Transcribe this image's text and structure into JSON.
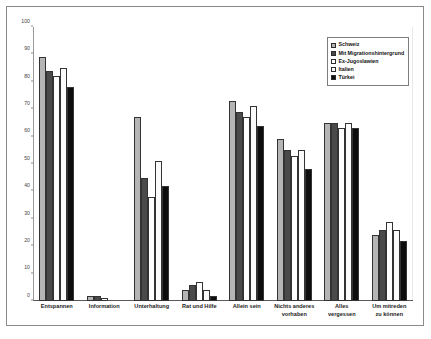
{
  "figure": {
    "cut_heading_text": "",
    "frame_color": "#8a8a8a",
    "background": "#ffffff"
  },
  "legend": {
    "position": "top-right",
    "items": [
      {
        "label": "Schweiz",
        "color": "#b5b5b5",
        "swatch": "legend-swatch-light-gray"
      },
      {
        "label": "Mit Migrationshintergrund",
        "color": "#4a4a4a",
        "swatch": "legend-swatch-dark-gray"
      },
      {
        "label": "Ex-Jugoslawien",
        "color": "#ffffff",
        "swatch": "legend-swatch-white"
      },
      {
        "label": "Italien",
        "color": "#fbfbfb",
        "swatch": "legend-swatch-offwhite"
      },
      {
        "label": "Türkei",
        "color": "#0d0d0d",
        "swatch": "legend-swatch-black"
      }
    ]
  },
  "axes": {
    "y_ticks": [
      "0",
      "10",
      "20",
      "30",
      "40",
      "50",
      "60",
      "70",
      "80",
      "90",
      "100"
    ],
    "x_tick_lines": [
      [
        "Entspannen"
      ],
      [
        "Information"
      ],
      [
        "Unterhaltung"
      ],
      [
        "Rat und Hilfe"
      ],
      [
        "Allein sein"
      ],
      [
        "Nichts anderes",
        "vorhaben"
      ],
      [
        "Alles",
        "vergessen"
      ],
      [
        "Um mitreden",
        "zu können"
      ]
    ]
  },
  "chart_data": {
    "type": "bar",
    "title": "",
    "subtitle": "",
    "xlabel": "",
    "ylabel": "",
    "ylim": [
      0,
      100
    ],
    "ytick_step": 10,
    "grid": false,
    "legend_position": "top-right",
    "orientation": "vertical",
    "grouping": "grouped",
    "categories": [
      "Entspannen",
      "Information",
      "Unterhaltung",
      "Rat und Hilfe",
      "Allein sein",
      "Nichts anderes vorhaben",
      "Alles vergessen",
      "Um mitreden zu können"
    ],
    "series": [
      {
        "name": "Schweiz",
        "color": "#b5b5b5",
        "values": [
          89,
          2,
          67,
          4,
          73,
          59,
          65,
          24
        ]
      },
      {
        "name": "Mit Migrationshintergrund",
        "color": "#4a4a4a",
        "values": [
          84,
          2,
          45,
          6,
          69,
          55,
          65,
          26
        ]
      },
      {
        "name": "Ex-Jugoslawien",
        "color": "#ffffff",
        "values": [
          82,
          1,
          38,
          7,
          67,
          53,
          63,
          29
        ]
      },
      {
        "name": "Italien",
        "color": "#fbfbfb",
        "values": [
          85,
          0,
          51,
          4,
          71,
          55,
          65,
          26
        ]
      },
      {
        "name": "Türkei",
        "color": "#0d0d0d",
        "values": [
          78,
          0,
          42,
          2,
          64,
          48,
          63,
          22
        ]
      }
    ]
  }
}
